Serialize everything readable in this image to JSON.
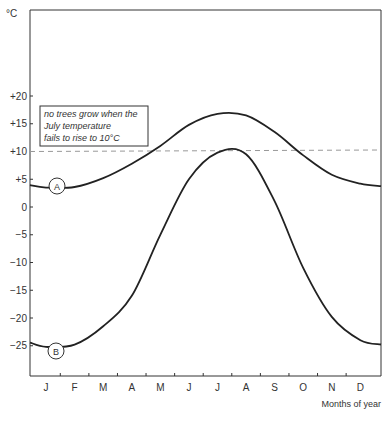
{
  "chart_data": {
    "type": "line",
    "title": "",
    "xlabel": "Months of year",
    "ylabel": "°C",
    "ylim": [
      -30,
      30
    ],
    "yticks": [
      "+20",
      "+15",
      "+10",
      "+5",
      "0",
      "-5",
      "-10",
      "-15",
      "-20",
      "-25"
    ],
    "categories": [
      "J",
      "F",
      "M",
      "A",
      "M",
      "J",
      "J",
      "A",
      "S",
      "O",
      "N",
      "D"
    ],
    "series": [
      {
        "name": "A",
        "values": [
          3.5,
          3.6,
          5.2,
          7.8,
          11.0,
          14.8,
          16.8,
          16.5,
          13.5,
          9.3,
          5.8,
          4.2
        ]
      },
      {
        "name": "B",
        "values": [
          -25.2,
          -24.8,
          -21.5,
          -16.0,
          -5.0,
          5.0,
          9.8,
          9.5,
          1.0,
          -11.0,
          -19.8,
          -24.0
        ]
      }
    ],
    "reference_line": {
      "value": 10,
      "style": "dashed"
    },
    "annotations": [
      {
        "text_lines": [
          "no trees grow when the",
          "July temperature",
          "fails to rise to 10°C"
        ]
      }
    ],
    "grid": false,
    "legend_position": "inline markers"
  },
  "labels": {
    "unit": "°C",
    "x_axis_title": "Months of year",
    "note_line1": "no trees grow when the",
    "note_line2": "July temperature",
    "note_line3": "fails to rise to 10°C",
    "marker_a": "A",
    "marker_b": "B"
  }
}
